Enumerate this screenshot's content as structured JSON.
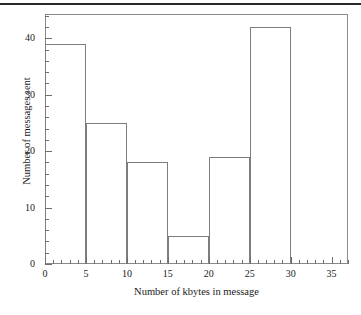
{
  "figure": {
    "top_rule": "",
    "frame_color": "#8a8a8a",
    "bar_line_color": "#7d7d7d"
  },
  "chart_data": {
    "type": "bar",
    "title": "",
    "subtitle": "",
    "xlabel": "Number of kbytes in message",
    "ylabel": "Number of messages sent",
    "bin_width": 5,
    "bin_edges": [
      0,
      5,
      10,
      15,
      20,
      25,
      30
    ],
    "categories": [
      "0-5",
      "5-10",
      "10-15",
      "15-20",
      "20-25",
      "25-30"
    ],
    "values": [
      39,
      25,
      18,
      5,
      19,
      42
    ],
    "xlim": [
      0,
      37
    ],
    "ylim": [
      0,
      44.3
    ],
    "x_major_ticks": [
      0,
      5,
      10,
      15,
      20,
      25,
      30,
      35
    ],
    "x_major_tick_labels": [
      "0",
      "5",
      "10",
      "15",
      "20",
      "25",
      "30",
      "35"
    ],
    "x_minor_tick_step": 1,
    "y_major_ticks": [
      0,
      10,
      20,
      30,
      40
    ],
    "y_major_tick_labels": [
      "0",
      "10",
      "20",
      "30",
      "40"
    ],
    "y_minor_tick_step": 2,
    "grid": false,
    "legend": null,
    "legend_position": "none",
    "annotations": []
  }
}
